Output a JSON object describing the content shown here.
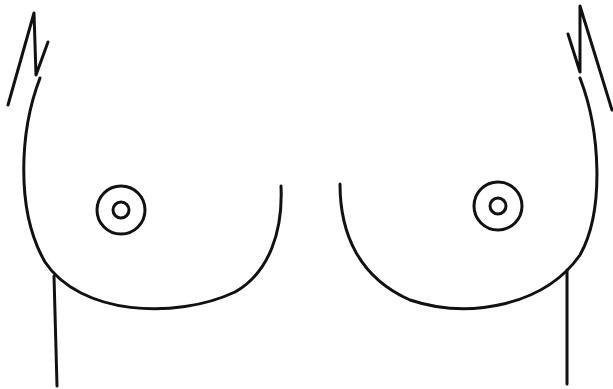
{
  "diagram": {
    "type": "anatomical line drawing",
    "stroke_color": "#111111",
    "background_color": "#ffffff",
    "stroke_width": 3
  }
}
